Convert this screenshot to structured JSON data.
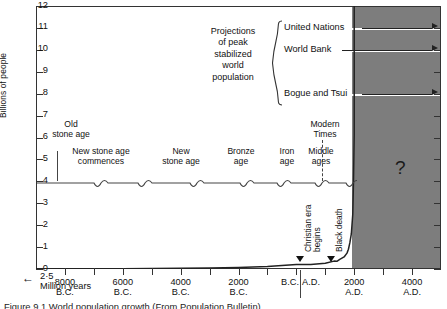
{
  "chart_data": {
    "type": "line",
    "title": "World population growth (From Population Bulletin)",
    "xlabel": "",
    "ylabel": "Billions of people",
    "ylim": [
      0,
      12
    ],
    "yticks": [
      0,
      1,
      2,
      3,
      4,
      5,
      6,
      7,
      8,
      9,
      10,
      11,
      12
    ],
    "grid": false,
    "x_axis_note": "← 2·5 Million years",
    "xticks": [
      {
        "value": -8000,
        "line1": "8000",
        "line2": "B.C."
      },
      {
        "value": -6000,
        "line1": "6000",
        "line2": "B.C."
      },
      {
        "value": -4000,
        "line1": "4000",
        "line2": "B.C."
      },
      {
        "value": -2000,
        "line1": "2000",
        "line2": "B.C."
      },
      {
        "value": -1,
        "line1": "B.C.",
        "line2": ""
      },
      {
        "value": 1,
        "line1": "A.D.",
        "line2": ""
      },
      {
        "value": 2000,
        "line1": "2000",
        "line2": "A.D."
      },
      {
        "value": 4000,
        "line1": "4000",
        "line2": "A.D."
      }
    ],
    "series": [
      {
        "name": "World population",
        "points": [
          [
            -9000,
            0.004
          ],
          [
            -8000,
            0.006
          ],
          [
            -7000,
            0.009
          ],
          [
            -6000,
            0.013
          ],
          [
            -5000,
            0.02
          ],
          [
            -4000,
            0.03
          ],
          [
            -3000,
            0.045
          ],
          [
            -2000,
            0.072
          ],
          [
            -1000,
            0.11
          ],
          [
            0,
            0.2
          ],
          [
            500,
            0.21
          ],
          [
            1000,
            0.265
          ],
          [
            1300,
            0.36
          ],
          [
            1400,
            0.35
          ],
          [
            1500,
            0.44
          ],
          [
            1650,
            0.55
          ],
          [
            1750,
            0.725
          ],
          [
            1800,
            0.9
          ],
          [
            1850,
            1.2
          ],
          [
            1900,
            1.6
          ],
          [
            1950,
            2.5
          ],
          [
            1975,
            4.0
          ],
          [
            1990,
            5.3
          ],
          [
            2000,
            6.1
          ]
        ]
      }
    ],
    "annotations": {
      "future_region_label": "?",
      "eras": [
        {
          "label": "Old\nstone age",
          "line1": "Old",
          "line2": "stone age"
        },
        {
          "label": "New stone age commences",
          "line1": "New stone age",
          "line2": "commences"
        },
        {
          "label": "New stone age",
          "line1": "New",
          "line2": "stone age"
        },
        {
          "label": "Bronze age",
          "line1": "Bronze",
          "line2": "age"
        },
        {
          "label": "Iron age",
          "line1": "Iron",
          "line2": "age"
        },
        {
          "label": "Middle ages",
          "line1": "Middle",
          "line2": "ages"
        },
        {
          "label": "Modern Times",
          "line1": "Modern",
          "line2": "Times"
        }
      ],
      "events": [
        {
          "label_line1": "Christian era",
          "label_line2": "begins"
        },
        {
          "label_line1": "Black death",
          "label_line2": ""
        }
      ]
    },
    "projections": {
      "title_lines": [
        "Projections",
        "of peak",
        "stabilized",
        "world",
        "population"
      ],
      "entries": [
        {
          "name": "United Nations",
          "value": 11.0
        },
        {
          "name": "World Bank",
          "value": 10.0
        },
        {
          "name": "Bogue and Tsui",
          "value": 8.0
        }
      ]
    },
    "colors": {
      "future_block": "#7d7d7d",
      "axis": "#333333",
      "curve": "#222222",
      "background": "#ffffff"
    }
  },
  "caption": {
    "text": "Figure 9.1  World population growth (From Population Bulletin)"
  }
}
